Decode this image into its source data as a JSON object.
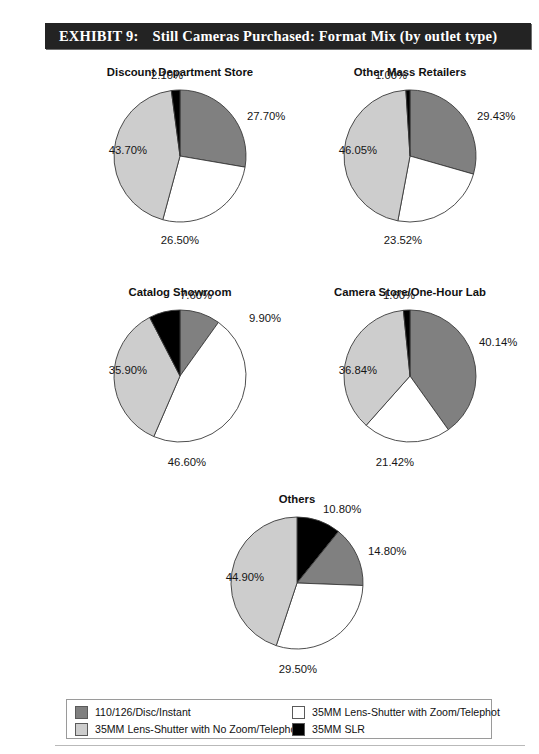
{
  "banner": {
    "number": "EXHIBIT 9:",
    "title": "Still Cameras Purchased: Format Mix (by outlet type)"
  },
  "colors": {
    "series_110_126": "#808080",
    "series_no_zoom": "#cdcdcd",
    "series_zoom": "#ffffff",
    "series_slr": "#000000",
    "banner_bg": "#232323",
    "outline": "#3a3a3a"
  },
  "legend": {
    "items": [
      {
        "label": "110/126/Disc/Instant",
        "color": "#808080",
        "column": 1
      },
      {
        "label": "35MM Lens-Shutter with No Zoom/Telephot",
        "color": "#cdcdcd",
        "column": 1
      },
      {
        "label": "35MM Lens-Shutter with Zoom/Telephot",
        "color": "#ffffff",
        "column": 2
      },
      {
        "label": "35MM SLR",
        "color": "#000000",
        "column": 2
      }
    ]
  },
  "chart_data": [
    {
      "type": "pie",
      "title": "Discount Department Store",
      "start_angle": 0,
      "labels": [
        "110/126/Disc/Instant",
        "35MM Lens-Shutter with Zoom/Telephot",
        "35MM Lens-Shutter with No Zoom/Telephot",
        "35MM SLR"
      ],
      "values": [
        27.7,
        26.5,
        43.7,
        2.1
      ],
      "colors": [
        "#808080",
        "#ffffff",
        "#cdcdcd",
        "#000000"
      ],
      "value_labels": [
        "27.70%",
        "26.50%",
        "43.70%",
        "2.10%"
      ]
    },
    {
      "type": "pie",
      "title": "Other Mass Retailers",
      "start_angle": 0,
      "labels": [
        "110/126/Disc/Instant",
        "35MM Lens-Shutter with Zoom/Telephot",
        "35MM Lens-Shutter with No Zoom/Telephot",
        "35MM SLR"
      ],
      "values": [
        29.43,
        23.52,
        46.05,
        1.0
      ],
      "colors": [
        "#808080",
        "#ffffff",
        "#cdcdcd",
        "#000000"
      ],
      "value_labels": [
        "29.43%",
        "23.52%",
        "46.05%",
        "1.00%"
      ]
    },
    {
      "type": "pie",
      "title": "Catalog Showroom",
      "start_angle": 0,
      "labels": [
        "110/126/Disc/Instant",
        "35MM Lens-Shutter with Zoom/Telephot",
        "35MM Lens-Shutter with No Zoom/Telephot",
        "35MM SLR"
      ],
      "values": [
        9.9,
        46.6,
        35.9,
        7.6
      ],
      "colors": [
        "#808080",
        "#ffffff",
        "#cdcdcd",
        "#000000"
      ],
      "value_labels": [
        "9.90%",
        "46.60%",
        "35.90%",
        "7.60%"
      ]
    },
    {
      "type": "pie",
      "title": "Camera Store/One-Hour Lab",
      "start_angle": 0,
      "labels": [
        "110/126/Disc/Instant",
        "35MM Lens-Shutter with Zoom/Telephot",
        "35MM Lens-Shutter with No Zoom/Telephot",
        "35MM SLR"
      ],
      "values": [
        40.14,
        21.42,
        36.84,
        1.6
      ],
      "colors": [
        "#808080",
        "#ffffff",
        "#cdcdcd",
        "#000000"
      ],
      "value_labels": [
        "40.14%",
        "21.42%",
        "36.84%",
        "1.60%"
      ]
    },
    {
      "type": "pie",
      "title": "Others",
      "start_angle": 0,
      "labels": [
        "35MM SLR",
        "110/126/Disc/Instant",
        "35MM Lens-Shutter with Zoom/Telephot",
        "35MM Lens-Shutter with No Zoom/Telephot"
      ],
      "values": [
        10.8,
        14.8,
        29.5,
        44.9
      ],
      "colors": [
        "#000000",
        "#808080",
        "#ffffff",
        "#cdcdcd"
      ],
      "value_labels": [
        "10.80%",
        "14.80%",
        "29.50%",
        "44.90%"
      ]
    }
  ],
  "layout": {
    "charts": [
      {
        "left": 95,
        "top": 66,
        "radius": 66,
        "cx": 85,
        "cy": 90,
        "label_pos": [
          {
            "x": 152,
            "y": 44,
            "align": "left"
          },
          {
            "x": 85,
            "y": 168,
            "align": "center"
          },
          {
            "x": -3,
            "y": 78,
            "align": "right"
          },
          {
            "x": 72,
            "y": 3,
            "align": "center"
          }
        ]
      },
      {
        "left": 325,
        "top": 66,
        "radius": 66,
        "cx": 85,
        "cy": 90,
        "label_pos": [
          {
            "x": 152,
            "y": 44,
            "align": "left"
          },
          {
            "x": 78,
            "y": 168,
            "align": "center"
          },
          {
            "x": -3,
            "y": 78,
            "align": "right"
          },
          {
            "x": 66,
            "y": 3,
            "align": "center"
          }
        ]
      },
      {
        "left": 95,
        "top": 286,
        "radius": 66,
        "cx": 85,
        "cy": 90,
        "label_pos": [
          {
            "x": 154,
            "y": 26,
            "align": "left"
          },
          {
            "x": 92,
            "y": 170,
            "align": "center"
          },
          {
            "x": -3,
            "y": 78,
            "align": "right"
          },
          {
            "x": 101,
            "y": 3,
            "align": "center"
          }
        ]
      },
      {
        "left": 325,
        "top": 286,
        "radius": 66,
        "cx": 85,
        "cy": 90,
        "label_pos": [
          {
            "x": 154,
            "y": 50,
            "align": "left"
          },
          {
            "x": 70,
            "y": 170,
            "align": "center"
          },
          {
            "x": -3,
            "y": 78,
            "align": "right"
          },
          {
            "x": 74,
            "y": 3,
            "align": "center"
          }
        ]
      },
      {
        "left": 212,
        "top": 493,
        "radius": 66,
        "cx": 85,
        "cy": 90,
        "label_pos": [
          {
            "x": 111,
            "y": 10,
            "align": "left"
          },
          {
            "x": 156,
            "y": 52,
            "align": "left"
          },
          {
            "x": 86,
            "y": 170,
            "align": "center"
          },
          {
            "x": -3,
            "y": 78,
            "align": "right"
          }
        ]
      }
    ]
  }
}
